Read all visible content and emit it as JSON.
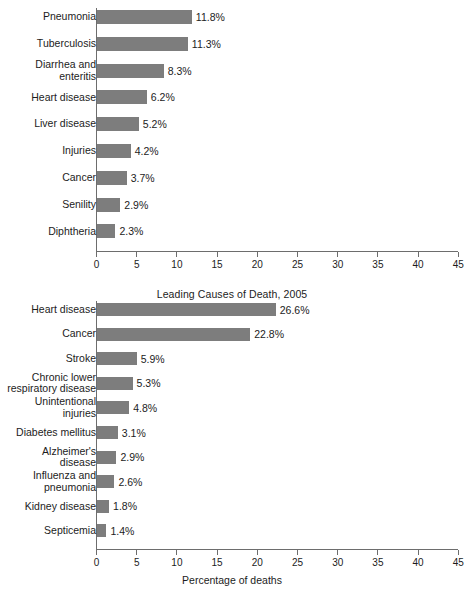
{
  "chart_data": [
    {
      "id": "top",
      "type": "bar",
      "orientation": "horizontal",
      "title": "",
      "xlabel": "",
      "ylabel": "",
      "xlim": [
        0,
        45
      ],
      "xticks": [
        0,
        5,
        10,
        15,
        20,
        25,
        30,
        35,
        40,
        45
      ],
      "xtick_labels": [
        "0",
        "5",
        "10",
        "15",
        "20",
        "25",
        "30",
        "35",
        "40",
        "45"
      ],
      "grid": false,
      "legend": "none",
      "bar_color": "#7d7d7d",
      "categories": [
        "Pneumonia",
        "Tuberculosis",
        "Diarrhea and\nenteritis",
        "Heart disease",
        "Liver disease",
        "Injuries",
        "Cancer",
        "Senility",
        "Diphtheria"
      ],
      "values": [
        11.8,
        11.3,
        8.3,
        6.2,
        5.2,
        4.2,
        3.7,
        2.9,
        2.3
      ],
      "value_labels": [
        "11.8%",
        "11.3%",
        "8.3%",
        "6.2%",
        "5.2%",
        "4.2%",
        "3.7%",
        "2.9%",
        "2.3%"
      ]
    },
    {
      "id": "bottom",
      "type": "bar",
      "orientation": "horizontal",
      "title": "Leading Causes of Death, 2005",
      "xlabel": "Percentage of deaths",
      "ylabel": "",
      "xlim": [
        0,
        45
      ],
      "xticks": [
        0,
        5,
        10,
        15,
        20,
        25,
        30,
        35,
        40,
        45
      ],
      "xtick_labels": [
        "0",
        "5",
        "10",
        "15",
        "20",
        "25",
        "30",
        "35",
        "40",
        "45"
      ],
      "grid": false,
      "legend": "none",
      "bar_color": "#7d7d7d",
      "categories": [
        "Heart disease",
        "Cancer",
        "Stroke",
        "Chronic lower\nrespiratory disease",
        "Unintentional\ninjuries",
        "Diabetes mellitus",
        "Alzheimer's\ndisease",
        "Influenza and\npneumonia",
        "Kidney disease",
        "Septicemia"
      ],
      "values": [
        26.6,
        22.8,
        5.9,
        5.3,
        4.8,
        3.1,
        2.9,
        2.6,
        1.8,
        1.4
      ],
      "value_labels": [
        "26.6%",
        "22.8%",
        "5.9%",
        "5.3%",
        "4.8%",
        "3.1%",
        "2.9%",
        "2.6%",
        "1.8%",
        "1.4%"
      ]
    }
  ]
}
